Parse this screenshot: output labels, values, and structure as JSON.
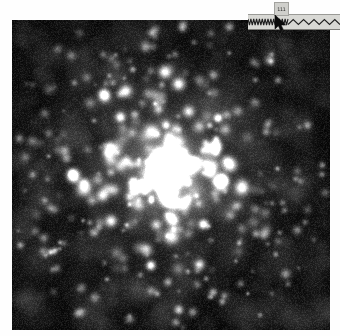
{
  "window": {
    "background_color": "#ffffff",
    "width": 340,
    "height": 336
  },
  "image_view": {
    "name": "astronomical-star-field",
    "description": "Dense noisy star cluster field with bright central core",
    "background_color": "#050505",
    "star_color": "#ffffff",
    "bounds": {
      "x": 12,
      "y": 20,
      "width": 318,
      "height": 310
    },
    "core": {
      "x": 157,
      "y": 151,
      "radius": 11,
      "brightness": 1.0
    }
  },
  "waveform_widget": {
    "name": "waveform-strip",
    "background_color": "#d8d8d4",
    "trace_color": "#202020",
    "left_segment": {
      "label": "high-frequency-zigzag",
      "cycles": 14,
      "amplitude": 6
    },
    "right_segment": {
      "label": "low-frequency-triangle",
      "cycles": 5,
      "amplitude": 5
    }
  },
  "tooltip": {
    "name": "value-readout",
    "text": "111",
    "background_color": "#cfcfcb",
    "border_color": "#a2a29e"
  },
  "cursor": {
    "name": "mouse-pointer",
    "color": "#0a0a0a",
    "x": 274,
    "y": 15
  }
}
